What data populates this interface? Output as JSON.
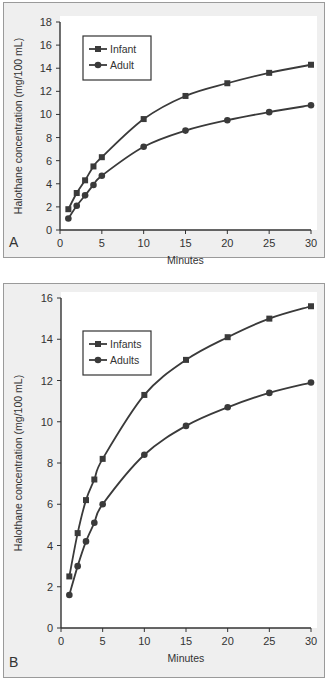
{
  "chart_data": [
    {
      "type": "line",
      "panel_label": "A",
      "title": "",
      "xlabel": "Minutes",
      "ylabel": "Halothane concentration (mg/100 mL)",
      "xlim": [
        0,
        30
      ],
      "ylim": [
        0,
        18
      ],
      "xticks": [
        0,
        5,
        10,
        15,
        20,
        25,
        30
      ],
      "yticks": [
        0,
        2,
        4,
        6,
        8,
        10,
        12,
        14,
        16,
        18
      ],
      "grid": false,
      "legend_position": "upper-left",
      "x": [
        1,
        2,
        3,
        4,
        5,
        10,
        15,
        20,
        25,
        30
      ],
      "series": [
        {
          "name": "Infant",
          "marker": "square",
          "values": [
            1.8,
            3.2,
            4.3,
            5.5,
            6.3,
            9.6,
            11.6,
            12.7,
            13.6,
            14.3
          ]
        },
        {
          "name": "Adult",
          "marker": "circle",
          "values": [
            1.0,
            2.1,
            3.0,
            3.9,
            4.7,
            7.2,
            8.6,
            9.5,
            10.2,
            10.8
          ]
        }
      ]
    },
    {
      "type": "line",
      "panel_label": "B",
      "title": "",
      "xlabel": "Minutes",
      "ylabel": "Halothane concentration (mg/100 mL)",
      "xlim": [
        0,
        30
      ],
      "ylim": [
        0,
        16
      ],
      "xticks": [
        0,
        5,
        10,
        15,
        20,
        25,
        30
      ],
      "yticks": [
        0,
        2,
        4,
        6,
        8,
        10,
        12,
        14,
        16
      ],
      "grid": false,
      "legend_position": "upper-left",
      "x": [
        1,
        2,
        3,
        4,
        5,
        10,
        15,
        20,
        25,
        30
      ],
      "series": [
        {
          "name": "Infants",
          "marker": "square",
          "values": [
            2.5,
            4.6,
            6.2,
            7.2,
            8.2,
            11.3,
            13.0,
            14.1,
            15.0,
            15.6
          ]
        },
        {
          "name": "Adults",
          "marker": "circle",
          "values": [
            1.6,
            3.0,
            4.2,
            5.1,
            6.0,
            8.4,
            9.8,
            10.7,
            11.4,
            11.9
          ]
        }
      ]
    }
  ],
  "colors": {
    "line": "#3a3a3a",
    "panel_bg": "#efefef",
    "plot_bg": "#ffffff"
  }
}
